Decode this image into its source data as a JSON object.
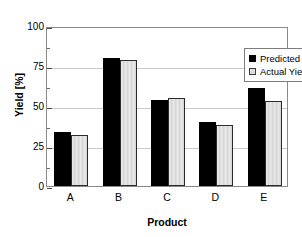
{
  "chart_data": {
    "type": "bar",
    "title": "",
    "xlabel": "Product",
    "ylabel": "Yield [%]",
    "categories": [
      "A",
      "B",
      "C",
      "D",
      "E"
    ],
    "series": [
      {
        "name": "Predicted Yield",
        "color": "#000000",
        "values": [
          34,
          80,
          54,
          40,
          61
        ]
      },
      {
        "name": "Actual Yield",
        "color": "#d2d2d2",
        "values": [
          32,
          79,
          55,
          38,
          53
        ]
      }
    ],
    "ylim": [
      0,
      100
    ],
    "yticks": [
      0,
      25,
      50,
      75,
      100
    ],
    "ytick_labels": [
      "0",
      "25",
      "50",
      "75",
      "100"
    ],
    "yminor_ticks": [
      12.5,
      37.5,
      62.5,
      87.5
    ],
    "grid": true,
    "grid_axis": "y",
    "legend_position": "top-right-inside",
    "frame": true
  }
}
